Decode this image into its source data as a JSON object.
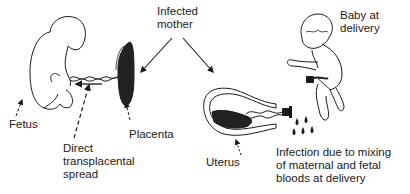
{
  "diagram": {
    "labels": {
      "infected_mother": [
        "Infected",
        "mother"
      ],
      "fetus": "Fetus",
      "placenta": "Placenta",
      "direct_spread": [
        "Direct",
        "transplacental",
        "spread"
      ],
      "uterus": "Uterus",
      "baby": [
        "Baby at",
        "delivery"
      ],
      "delivery_infection": [
        "Infection due to mixing",
        "of maternal and fetal",
        "bloods at delivery"
      ]
    },
    "colors": {
      "ink": "#1a1a1a",
      "background": "#ffffff"
    }
  }
}
